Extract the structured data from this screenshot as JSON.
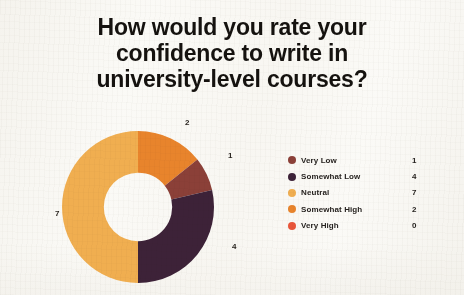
{
  "title": {
    "line1": "How would you rate your",
    "line2": "confidence to write in",
    "line3": "university-level courses?"
  },
  "chart_data": {
    "type": "pie",
    "variant": "donut",
    "title": "How would you rate your confidence to write in university-level courses?",
    "categories": [
      "Very Low",
      "Somewhat Low",
      "Neutral",
      "Somewhat High",
      "Very High"
    ],
    "values": [
      1,
      4,
      7,
      2,
      0
    ],
    "total": 14,
    "colors": [
      "#8B4038",
      "#3D2238",
      "#F0AE50",
      "#E8842C",
      "#E8553A"
    ],
    "legend_position": "right",
    "data_labels": true,
    "start_angle_deg": 0,
    "direction": "clockwise",
    "hole_ratio": 0.45,
    "slices": [
      {
        "label": "Somewhat High",
        "value": 2,
        "color": "#E8842C",
        "angle_deg": 51.4,
        "order": 1
      },
      {
        "label": "Very Low",
        "value": 1,
        "color": "#8B4038",
        "angle_deg": 25.7,
        "order": 2
      },
      {
        "label": "Somewhat Low",
        "value": 4,
        "color": "#3D2238",
        "angle_deg": 102.9,
        "order": 3
      },
      {
        "label": "Neutral",
        "value": 7,
        "color": "#F0AE50",
        "angle_deg": 180.0,
        "order": 4
      },
      {
        "label": "Very High",
        "value": 0,
        "color": "#E8553A",
        "angle_deg": 0.0,
        "order": 5
      }
    ]
  },
  "slice_labels": {
    "somewhat_high": "2",
    "very_low": "1",
    "somewhat_low": "4",
    "neutral": "7"
  },
  "legend": {
    "rows": [
      {
        "label": "Very Low",
        "value": "1",
        "color": "#8B4038"
      },
      {
        "label": "Somewhat Low",
        "value": "4",
        "color": "#3D2238"
      },
      {
        "label": "Neutral",
        "value": "7",
        "color": "#F0AE50"
      },
      {
        "label": "Somewhat High",
        "value": "2",
        "color": "#E8842C"
      },
      {
        "label": "Very High",
        "value": "0",
        "color": "#E8553A"
      }
    ]
  },
  "palette": {
    "background": "#faf9f5",
    "text": "#15120f",
    "very_low": "#8B4038",
    "somewhat_low": "#3D2238",
    "neutral": "#F0AE50",
    "somewhat_high": "#E8842C",
    "very_high": "#E8553A"
  }
}
